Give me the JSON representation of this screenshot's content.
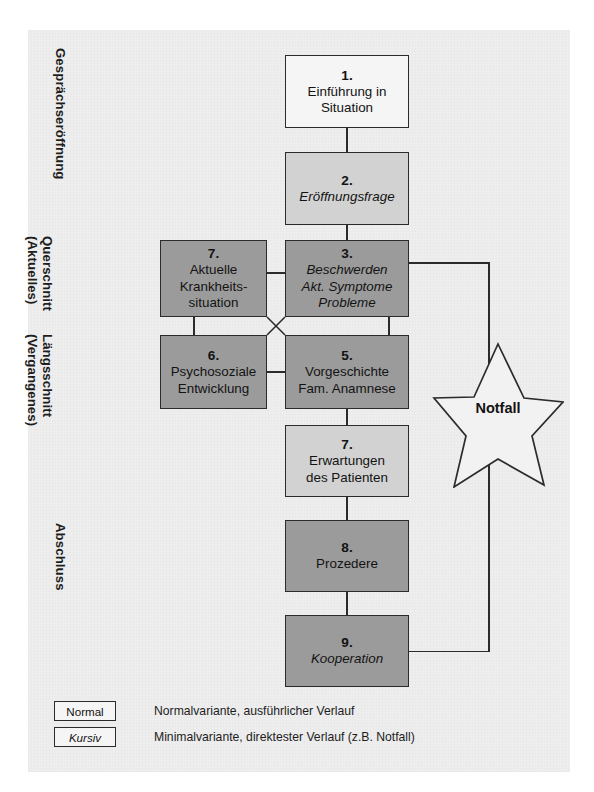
{
  "figure": {
    "type": "flowchart"
  },
  "stage_labels": [
    {
      "id": "gespraechseroeffnung",
      "text": "Gesprächseröffnung",
      "x": 68,
      "y": 48
    },
    {
      "id": "querschnitt",
      "text": "Querschnitt\n(Aktuelles)",
      "x": 55,
      "y": 236
    },
    {
      "id": "laengsschnitt",
      "text": "Längsschnitt\n(Vergangenes)",
      "x": 55,
      "y": 334
    },
    {
      "id": "abschluss",
      "text": "Abschluss",
      "x": 68,
      "y": 523
    }
  ],
  "nodes": [
    {
      "id": "n1",
      "num": "1.",
      "lines": [
        "Einführung in",
        "Situation"
      ],
      "style": "normal",
      "fill": "white",
      "x": 285,
      "y": 55,
      "w": 124,
      "h": 73
    },
    {
      "id": "n2",
      "num": "2.",
      "lines": [
        "Eröffnungsfrage"
      ],
      "style": "italic",
      "fill": "light",
      "x": 285,
      "y": 152,
      "w": 124,
      "h": 73
    },
    {
      "id": "n3",
      "num": "3.",
      "lines": [
        "Beschwerden",
        "Akt. Symptome",
        "Probleme"
      ],
      "style": "italic",
      "fill": "dark",
      "x": 285,
      "y": 240,
      "w": 124,
      "h": 77
    },
    {
      "id": "n7a",
      "num": "7.",
      "lines": [
        "Aktuelle",
        "Krankheits-",
        "situation"
      ],
      "style": "normal",
      "fill": "dark",
      "x": 160,
      "y": 240,
      "w": 107,
      "h": 77
    },
    {
      "id": "n6",
      "num": "6.",
      "lines": [
        "Psychosoziale",
        "Entwicklung"
      ],
      "style": "normal",
      "fill": "dark",
      "x": 160,
      "y": 335,
      "w": 107,
      "h": 74
    },
    {
      "id": "n5",
      "num": "5.",
      "lines": [
        "Vorgeschichte",
        "Fam. Anamnese"
      ],
      "style": "normal",
      "fill": "dark",
      "x": 285,
      "y": 335,
      "w": 124,
      "h": 74
    },
    {
      "id": "n7b",
      "num": "7.",
      "lines": [
        "Erwartungen",
        "des Patienten"
      ],
      "style": "normal",
      "fill": "light",
      "x": 285,
      "y": 425,
      "w": 124,
      "h": 72
    },
    {
      "id": "n8",
      "num": "8.",
      "lines": [
        "Prozedere"
      ],
      "style": "normal",
      "fill": "dark",
      "x": 285,
      "y": 520,
      "w": 124,
      "h": 72
    },
    {
      "id": "n9",
      "num": "9.",
      "lines": [
        "Kooperation"
      ],
      "style": "italic",
      "fill": "dark",
      "x": 285,
      "y": 615,
      "w": 124,
      "h": 72
    }
  ],
  "star": {
    "label": "Notfall"
  },
  "legend": {
    "rows": [
      {
        "chip": "Normal",
        "chip_style": "normal",
        "text": "Normalvariante, ausführlicher Verlauf"
      },
      {
        "chip": "Kursiv",
        "chip_style": "italic",
        "text": "Minimalvariante, direktester Verlauf (z.B. Notfall)"
      }
    ]
  },
  "colors": {
    "panel_background": "#eeeeee",
    "box_dark": "#9b9b9b",
    "box_light": "#d2d2d2",
    "box_white": "#f5f5f5",
    "line": "#2b2b2b",
    "text": "#131313"
  }
}
